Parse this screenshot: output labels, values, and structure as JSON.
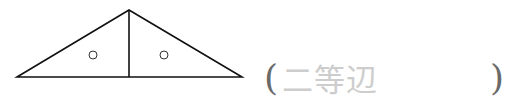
{
  "figure": {
    "type": "isosceles-triangle-split-by-median",
    "vertices": {
      "left": [
        17,
        77
      ],
      "apex": [
        129,
        10
      ],
      "right": [
        242,
        77
      ]
    },
    "median_line": {
      "from": [
        129,
        10
      ],
      "to": [
        129,
        77
      ]
    },
    "equal_angle_marks": [
      {
        "cx": 93,
        "cy": 55,
        "r": 4,
        "symbol": "○"
      },
      {
        "cx": 164,
        "cy": 55,
        "r": 4,
        "symbol": "○"
      }
    ],
    "stroke_color": "#111111"
  },
  "answer": {
    "open_paren": "(",
    "text": "二等辺",
    "close_paren": ")",
    "text_color": "#cdcdcd",
    "paren_color": "#6a6a6a"
  }
}
